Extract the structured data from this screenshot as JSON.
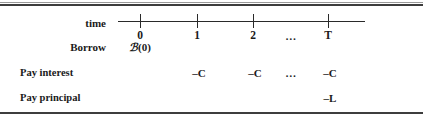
{
  "figure": {
    "background_color": "#ffffff",
    "text_color": "#1a1a1a",
    "rule_color": "#3d3d3d"
  },
  "axis": {
    "label": "time",
    "ticks": [
      {
        "label": "0",
        "x": 140
      },
      {
        "label": "1",
        "x": 197
      },
      {
        "label": "2",
        "x": 253
      },
      {
        "label": "T",
        "x": 328
      }
    ],
    "ellipsis": {
      "label": "…",
      "x": 291
    },
    "line_start_x": 118,
    "line_end_x": 365
  },
  "rows": [
    {
      "label": "Borrow",
      "cells": [
        {
          "value": "ℬ (0)",
          "at": "0"
        }
      ]
    },
    {
      "label": "Pay interest",
      "cells": [
        {
          "value": "–C",
          "at": "1"
        },
        {
          "value": "–C",
          "at": "2"
        },
        {
          "value": "…",
          "at": "ellipsis"
        },
        {
          "value": "–C",
          "at": "T"
        }
      ]
    },
    {
      "label": "Pay principal",
      "cells": [
        {
          "value": "–L",
          "at": "T"
        }
      ]
    }
  ],
  "borrow": {
    "symbol": "ℬ",
    "argument": "(0)"
  },
  "interest": {
    "t1": "–C",
    "t2": "–C",
    "ellipsis": "…",
    "tT": "–C"
  },
  "principal": {
    "tT": "–L"
  }
}
